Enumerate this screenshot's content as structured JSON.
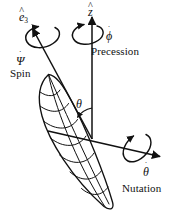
{
  "figure": {
    "background_color": "#ffffff",
    "stroke_color": "#111111",
    "width": 185,
    "height": 222
  },
  "axes": [
    {
      "name": "body-symmetry-axis",
      "symbol_base": "e",
      "symbol_hat": "^",
      "symbol_sub": "3",
      "description": "body symmetry axis pointing up-left"
    },
    {
      "name": "space-vertical-axis",
      "symbol_base": "z",
      "symbol_hat": "^",
      "symbol_sub": "",
      "description": "space-fixed vertical axis"
    },
    {
      "name": "line-of-nodes-axis",
      "symbol_base": "",
      "symbol_hat": "",
      "symbol_sub": "",
      "description": "line of nodes pointing right-down"
    }
  ],
  "labels": {
    "e3": {
      "base": "e",
      "hat": "^",
      "sub": "3"
    },
    "z": {
      "base": "z",
      "hat": "^"
    },
    "psi_dot": {
      "base": "Ψ",
      "dot": "˙"
    },
    "spin": "Spin",
    "phi_dot": {
      "base": "ϕ",
      "dot": "˙"
    },
    "precession": "Precession",
    "theta_dot": {
      "base": "θ",
      "dot": "˙"
    },
    "nutation": "Nutation",
    "theta": "θ"
  },
  "rotations": [
    {
      "name": "spin",
      "symbol": "Ψ̇",
      "label": "Spin",
      "about": "e3"
    },
    {
      "name": "precession",
      "symbol": "ϕ̇",
      "label": "Precession",
      "about": "z"
    },
    {
      "name": "nutation",
      "symbol": "θ̇",
      "label": "Nutation",
      "about": "line-of-nodes"
    }
  ],
  "angle": {
    "name": "theta",
    "symbol": "θ",
    "between": [
      "e3",
      "z"
    ]
  }
}
